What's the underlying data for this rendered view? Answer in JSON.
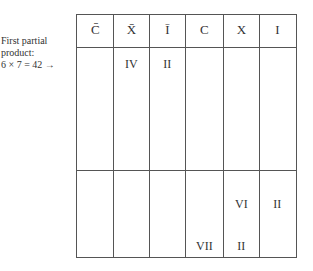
{
  "caption": {
    "line1": "First partial",
    "line2": "product:",
    "line3": "6 × 7 = 42 →"
  },
  "table": {
    "headers": [
      "C̄",
      "X̄",
      "Ī",
      "C",
      "X",
      "I"
    ],
    "rows": [
      {
        "cells": [
          "",
          "IV",
          "II",
          "",
          "",
          ""
        ]
      },
      {
        "cells": [
          "",
          "",
          "",
          "",
          "VI",
          "II"
        ]
      },
      {
        "cells": [
          "",
          "",
          "",
          "VII",
          "II",
          ""
        ]
      }
    ]
  }
}
